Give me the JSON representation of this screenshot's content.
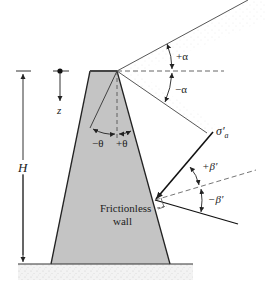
{
  "diagram": {
    "type": "retaining-wall-geometry",
    "labels": {
      "height": "H",
      "depth": "z",
      "alpha_pos": "+α",
      "alpha_neg": "−α",
      "theta_neg": "−θ",
      "theta_pos": "+θ",
      "beta_pos": "+β′",
      "beta_neg": "−β′",
      "stress": "σ′",
      "stress_sub": "a",
      "wall_line1": "Frictionless",
      "wall_line2": "wall"
    },
    "colors": {
      "wall_fill": "#c4c4c4",
      "line": "#222222",
      "ground_fill": "#e6e6e6",
      "backfill_stipple": "#dadada"
    }
  }
}
